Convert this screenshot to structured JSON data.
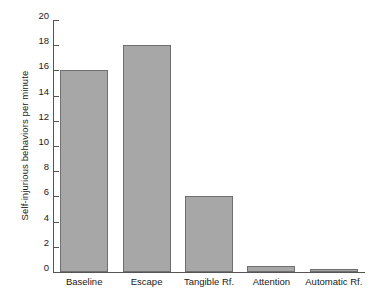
{
  "chart_data": {
    "type": "bar",
    "title": "",
    "xlabel": "",
    "ylabel": "Self-injurious behaviors per minute",
    "categories": [
      "Baseline",
      "Escape",
      "Tangible Rf.",
      "Attention",
      "Automatic Rf."
    ],
    "values": [
      16.0,
      18.0,
      6.0,
      0.5,
      0.25
    ],
    "ylim": [
      0,
      20
    ],
    "yticks": [
      0,
      2,
      4,
      6,
      8,
      10,
      12,
      14,
      16,
      18,
      20
    ],
    "ytick_labels": [
      "0",
      "2",
      "4",
      "6",
      "8",
      "10",
      "12",
      "14",
      "16",
      "18",
      "20"
    ],
    "grid": false,
    "legend": null,
    "bar_color": "#a7a7a7",
    "bar_edge_color": "#6f6f6f",
    "axis_color": "#555555",
    "text_color": "#1a1a1a",
    "background": "#ffffff"
  }
}
